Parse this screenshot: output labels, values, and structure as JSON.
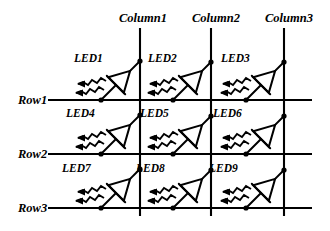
{
  "figure": {
    "kind": "led-matrix-schematic",
    "background_color": "#ffffff",
    "line_color": "#000000"
  },
  "columns": [
    {
      "id": "column1",
      "label": "Column1",
      "label_x": 143,
      "label_y": 22,
      "line_x": 140
    },
    {
      "id": "column2",
      "label": "Column2",
      "label_x": 216,
      "label_y": 22,
      "line_x": 211
    },
    {
      "id": "column3",
      "label": "Column3",
      "label_x": 289,
      "label_y": 22,
      "line_x": 284
    }
  ],
  "column_line_top": 28,
  "column_line_bottom": 216,
  "rows": [
    {
      "id": "row1",
      "label": "Row1",
      "label_x": 18,
      "label_y": 104,
      "line_y": 100,
      "line_x_start": 48,
      "line_x_end": 312
    },
    {
      "id": "row2",
      "label": "Row2",
      "label_x": 18,
      "label_y": 158,
      "line_y": 154,
      "line_x_start": 48,
      "line_x_end": 312
    },
    {
      "id": "row3",
      "label": "Row3",
      "label_x": 18,
      "label_y": 212,
      "line_y": 208,
      "line_x_start": 48,
      "line_x_end": 312
    }
  ],
  "leds": [
    {
      "id": "led1",
      "label": "LED1",
      "label_x": 74,
      "label_y": 62,
      "cx": 116,
      "cy": 85,
      "row": "row1",
      "column": "column1"
    },
    {
      "id": "led2",
      "label": "LED2",
      "label_x": 148,
      "label_y": 62,
      "cx": 188,
      "cy": 85,
      "row": "row1",
      "column": "column2"
    },
    {
      "id": "led3",
      "label": "LED3",
      "label_x": 221,
      "label_y": 62,
      "cx": 261,
      "cy": 85,
      "row": "row1",
      "column": "column3"
    },
    {
      "id": "led4",
      "label": "LED4",
      "label_x": 66,
      "label_y": 117,
      "cx": 116,
      "cy": 139,
      "row": "row2",
      "column": "column1"
    },
    {
      "id": "led5",
      "label": "LED5",
      "label_x": 140,
      "label_y": 117,
      "cx": 188,
      "cy": 139,
      "row": "row2",
      "column": "column2"
    },
    {
      "id": "led6",
      "label": "LED6",
      "label_x": 213,
      "label_y": 117,
      "cx": 261,
      "cy": 139,
      "row": "row2",
      "column": "column3"
    },
    {
      "id": "led7",
      "label": "LED7",
      "label_x": 62,
      "label_y": 172,
      "cx": 116,
      "cy": 193,
      "row": "row3",
      "column": "column1"
    },
    {
      "id": "led8",
      "label": "LED8",
      "label_x": 136,
      "label_y": 172,
      "cx": 188,
      "cy": 193,
      "row": "row3",
      "column": "column2"
    },
    {
      "id": "led9",
      "label": "LED9",
      "label_x": 209,
      "label_y": 172,
      "cx": 261,
      "cy": 193,
      "row": "row3",
      "column": "column3"
    }
  ],
  "symbol_geometry": {
    "note": "diode rotated 45 degrees, triangle apex pointing up-right to the column line, cathode bar perpendicular, two wavy emission arrows pointing left",
    "anode_lead_dx": 22,
    "anode_lead_dy": -22,
    "cathode_lead_dx": -18,
    "cathode_lead_dy": 18,
    "triangle_size": 20,
    "bar_half_length": 13,
    "ray_count": 2
  }
}
